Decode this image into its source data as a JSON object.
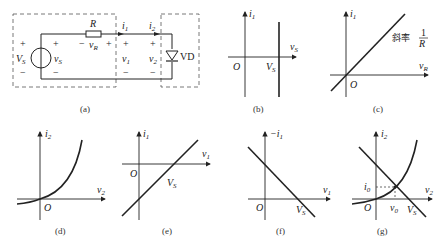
{
  "figure": {
    "panels": [
      {
        "id": "a",
        "caption": "(a)",
        "type": "circuit",
        "labels": {
          "source": "V",
          "source_sub": "S",
          "vs": "v",
          "vs_sub": "S",
          "resistor": "R",
          "vr": "v",
          "vr_sub": "R",
          "i1": "i",
          "i1_sub": "1",
          "i2": "i",
          "i2_sub": "2",
          "v1": "v",
          "v1_sub": "1",
          "v2": "v",
          "v2_sub": "2",
          "diode": "VD",
          "plus": "+",
          "minus": "−"
        }
      },
      {
        "id": "b",
        "caption": "(b)",
        "type": "plot",
        "y_axis": "i",
        "y_sub": "1",
        "x_axis": "v",
        "x_sub": "S",
        "origin": "O",
        "mark": "V",
        "mark_sub": "S"
      },
      {
        "id": "c",
        "caption": "(c)",
        "type": "plot",
        "y_axis": "i",
        "y_sub": "1",
        "x_axis": "v",
        "x_sub": "R",
        "origin": "O",
        "slope_text": "斜率",
        "slope_num": "1",
        "slope_den": "R"
      },
      {
        "id": "d",
        "caption": "(d)",
        "type": "plot",
        "y_axis": "i",
        "y_sub": "2",
        "x_axis": "v",
        "x_sub": "2",
        "origin": "O"
      },
      {
        "id": "e",
        "caption": "(e)",
        "type": "plot",
        "y_axis": "i",
        "y_sub": "1",
        "x_axis": "v",
        "x_sub": "1",
        "origin": "O",
        "mark": "V",
        "mark_sub": "S"
      },
      {
        "id": "f",
        "caption": "(f)",
        "type": "plot",
        "y_axis": "−i",
        "y_sub": "1",
        "x_axis": "v",
        "x_sub": "1",
        "origin": "O",
        "mark": "V",
        "mark_sub": "S"
      },
      {
        "id": "g",
        "caption": "(g)",
        "type": "plot",
        "y_axis": "i",
        "y_sub": "2",
        "x_axis": "v",
        "x_sub": "2",
        "origin": "O",
        "mark": "V",
        "mark_sub": "S",
        "i0": "i",
        "i0_sub": "0",
        "v0": "v",
        "v0_sub": "0"
      }
    ]
  }
}
